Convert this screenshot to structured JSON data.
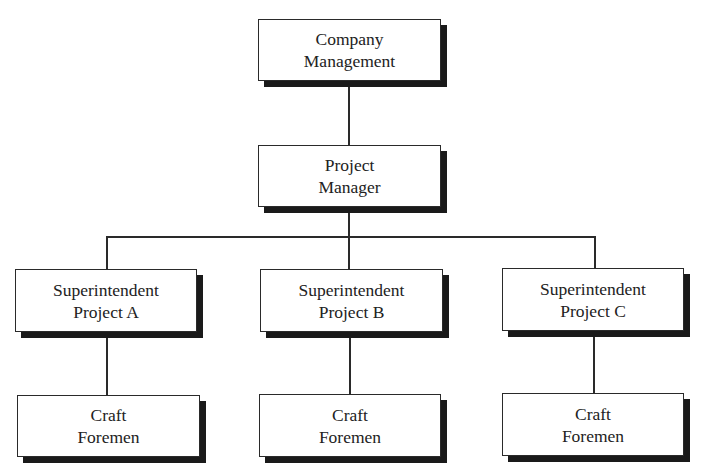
{
  "diagram": {
    "type": "organization-chart",
    "root": {
      "line1": "Company",
      "line2": "Management"
    },
    "manager": {
      "line1": "Project",
      "line2": "Manager"
    },
    "superintendents": [
      {
        "line1": "Superintendent",
        "line2": "Project A"
      },
      {
        "line1": "Superintendent",
        "line2": "Project B"
      },
      {
        "line1": "Superintendent",
        "line2": "Project C"
      }
    ],
    "foremen": [
      {
        "line1": "Craft",
        "line2": "Foremen"
      },
      {
        "line1": "Craft",
        "line2": "Foremen"
      },
      {
        "line1": "Craft",
        "line2": "Foremen"
      }
    ],
    "colors": {
      "line": "#2a2a2a",
      "shadow": "#1a1a1a",
      "background": "#ffffff"
    }
  }
}
